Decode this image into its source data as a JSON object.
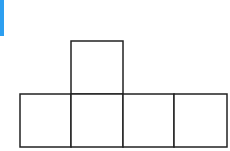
{
  "accent": {
    "color": "#2d9ff0"
  },
  "diagram": {
    "type": "cube-net",
    "stroke_color": "#222222",
    "stroke_width": 1.5,
    "fill_color": "#ffffff",
    "squares": [
      {
        "id": "top",
        "x": 71,
        "y": 41,
        "w": 52,
        "h": 53
      },
      {
        "id": "bottom-1",
        "x": 20,
        "y": 94,
        "w": 51,
        "h": 53
      },
      {
        "id": "bottom-2",
        "x": 71,
        "y": 94,
        "w": 52,
        "h": 53
      },
      {
        "id": "bottom-3",
        "x": 123,
        "y": 94,
        "w": 51,
        "h": 53
      },
      {
        "id": "bottom-4",
        "x": 174,
        "y": 94,
        "w": 53,
        "h": 53
      }
    ]
  }
}
